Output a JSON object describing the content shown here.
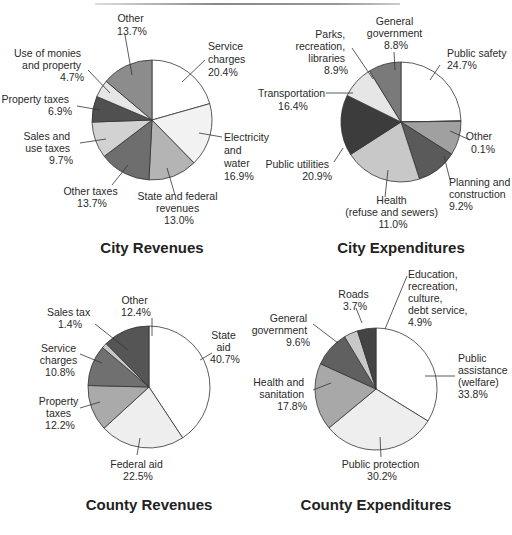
{
  "chart_data": [
    {
      "type": "pie",
      "title": "City Revenues",
      "center": [
        152,
        120
      ],
      "radius": 60,
      "slices": [
        {
          "label": "Service charges",
          "value": 20.4,
          "color": "#ffffff"
        },
        {
          "label": "Electricity and water",
          "value": 16.9,
          "color": "#f2f2f2"
        },
        {
          "label": "State and federal revenues",
          "value": 13.0,
          "color": "#b4b4b4"
        },
        {
          "label": "Other taxes",
          "value": 13.7,
          "color": "#6e6e6e"
        },
        {
          "label": "Sales and use taxes",
          "value": 9.7,
          "color": "#d2d2d2"
        },
        {
          "label": "Property taxes",
          "value": 6.9,
          "color": "#505050"
        },
        {
          "label": "Use of monies and property",
          "value": 4.7,
          "color": "#e6e6e6"
        },
        {
          "label": "Other",
          "value": 13.7,
          "color": "#8c8c8c"
        }
      ]
    },
    {
      "type": "pie",
      "title": "City Expenditures",
      "center": [
        401,
        122
      ],
      "radius": 60,
      "slices": [
        {
          "label": "Public safety",
          "value": 24.7,
          "color": "#ffffff"
        },
        {
          "label": "Other",
          "value": 0.1,
          "color": "#a0a0a0"
        },
        {
          "label": "Planning and construction",
          "value": 9.2,
          "color": "#a0a0a0"
        },
        {
          "label": "Health (refuse and sewers)",
          "value": 11.0,
          "color": "#5a5a5a"
        },
        {
          "label": "Public utilities",
          "value": 20.9,
          "color": "#c8c8c8"
        },
        {
          "label": "Transportation",
          "value": 16.4,
          "color": "#3c3c3c"
        },
        {
          "label": "Parks, recreation, libraries",
          "value": 8.9,
          "color": "#e6e6e6"
        },
        {
          "label": "General government",
          "value": 8.8,
          "color": "#7a7a7a"
        }
      ],
      "note": "slice for General government includes narrow lighter wedge"
    },
    {
      "type": "pie",
      "title": "County Revenues",
      "center": [
        149,
        387
      ],
      "radius": 61,
      "slices": [
        {
          "label": "State aid",
          "value": 40.7,
          "color": "#ffffff"
        },
        {
          "label": "Federal aid",
          "value": 22.5,
          "color": "#eeeeee"
        },
        {
          "label": "Property taxes",
          "value": 12.2,
          "color": "#aaaaaa"
        },
        {
          "label": "Service charges",
          "value": 10.8,
          "color": "#707070"
        },
        {
          "label": "Sales tax",
          "value": 1.4,
          "color": "#c8c8c8"
        },
        {
          "label": "Other",
          "value": 12.4,
          "color": "#555555"
        }
      ]
    },
    {
      "type": "pie",
      "title": "County Expenditures",
      "center": [
        376,
        389
      ],
      "radius": 61,
      "slices": [
        {
          "label": "Public assistance (welfare)",
          "value": 33.8,
          "color": "#ffffff"
        },
        {
          "label": "Public protection",
          "value": 30.2,
          "color": "#eeeeee"
        },
        {
          "label": "Health and sanitation",
          "value": 17.8,
          "color": "#a8a8a8"
        },
        {
          "label": "General government",
          "value": 9.6,
          "color": "#606060"
        },
        {
          "label": "Roads",
          "value": 3.7,
          "color": "#c8c8c8"
        },
        {
          "label": "Education, recreation, culture, debt service",
          "value": 4.9,
          "color": "#444444"
        }
      ]
    }
  ],
  "charts": {
    "city_revenues": {
      "title": "City Revenues",
      "labels": [
        {
          "lines": [
            "Other",
            "13.7%"
          ]
        },
        {
          "lines": [
            "Service",
            "charges",
            "20.4%"
          ]
        },
        {
          "lines": [
            "Use of monies",
            "and property",
            "4.7%"
          ]
        },
        {
          "lines": [
            "Property taxes",
            "6.9%"
          ]
        },
        {
          "lines": [
            "Sales and",
            "use taxes",
            "9.7%"
          ]
        },
        {
          "lines": [
            "Electricity",
            "and",
            "water",
            "16.9%"
          ]
        },
        {
          "lines": [
            "Other taxes",
            "13.7%"
          ]
        },
        {
          "lines": [
            "State and federal",
            "revenues",
            "13.0%"
          ]
        }
      ]
    },
    "city_expenditures": {
      "title": "City Expenditures",
      "labels": [
        {
          "lines": [
            "General",
            "government",
            "8.8%"
          ]
        },
        {
          "lines": [
            "Parks,",
            "recreation,",
            "libraries",
            "8.9%"
          ]
        },
        {
          "lines": [
            "Public safety",
            "24.7%"
          ]
        },
        {
          "lines": [
            "Transportation",
            "16.4%"
          ]
        },
        {
          "lines": [
            "Other",
            "0.1%"
          ]
        },
        {
          "lines": [
            "Public utilities",
            "20.9%"
          ]
        },
        {
          "lines": [
            "Planning and",
            "construction",
            "9.2%"
          ]
        },
        {
          "lines": [
            "Health",
            "(refuse and sewers)",
            "11.0%"
          ]
        }
      ]
    },
    "county_revenues": {
      "title": "County Revenues",
      "labels": [
        {
          "lines": [
            "Other",
            "12.4%"
          ]
        },
        {
          "lines": [
            "Sales tax",
            "1.4%"
          ]
        },
        {
          "lines": [
            "State",
            "aid",
            "40.7%"
          ]
        },
        {
          "lines": [
            "Service",
            "charges",
            "10.8%"
          ]
        },
        {
          "lines": [
            "Property",
            "taxes",
            "12.2%"
          ]
        },
        {
          "lines": [
            "Federal aid",
            "22.5%"
          ]
        }
      ]
    },
    "county_expenditures": {
      "title": "County Expenditures",
      "labels": [
        {
          "lines": [
            "Education,",
            "recreation,",
            "culture,",
            "debt service,",
            "4.9%"
          ]
        },
        {
          "lines": [
            "Roads",
            "3.7%"
          ]
        },
        {
          "lines": [
            "General",
            "government",
            "9.6%"
          ]
        },
        {
          "lines": [
            "Public",
            "assistance",
            "(welfare)",
            "33.8%"
          ]
        },
        {
          "lines": [
            "Health and",
            "sanitation",
            "17.8%"
          ]
        },
        {
          "lines": [
            "Public protection",
            "30.2%"
          ]
        }
      ]
    }
  }
}
